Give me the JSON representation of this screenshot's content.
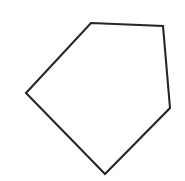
{
  "canvas": {
    "width": 185,
    "height": 181,
    "background_color": "#ffffff",
    "alt_text": "Irregular pentagon outline"
  },
  "figure": {
    "name": "pentagon",
    "shape_type": "polygon",
    "side_count": 5,
    "label": "Irregular pentagon",
    "stroke_color": "#262626",
    "fill_color": "#ffffff",
    "stroke_width": 2.1,
    "vertices": [
      {
        "name": "top-left-vertex",
        "x": 91,
        "y": 23
      },
      {
        "name": "top-right-vertex",
        "x": 163,
        "y": 26
      },
      {
        "name": "right-vertex",
        "x": 170,
        "y": 108
      },
      {
        "name": "bottom-vertex",
        "x": 105,
        "y": 174
      },
      {
        "name": "left-vertex",
        "x": 26,
        "y": 93
      }
    ],
    "edges": [
      {
        "name": "top-edge",
        "from": "top-left-vertex",
        "to": "top-right-vertex"
      },
      {
        "name": "right-edge",
        "from": "top-right-vertex",
        "to": "right-vertex"
      },
      {
        "name": "lower-right-edge",
        "from": "right-vertex",
        "to": "bottom-vertex"
      },
      {
        "name": "lower-left-edge",
        "from": "bottom-vertex",
        "to": "left-vertex"
      },
      {
        "name": "upper-left-edge",
        "from": "left-vertex",
        "to": "top-left-vertex"
      }
    ],
    "points_attr": "91,23 163,26 170,108 105,174 26,93"
  }
}
